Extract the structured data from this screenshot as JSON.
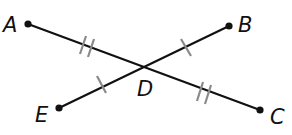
{
  "diagram": {
    "points": {
      "A": {
        "label": "A",
        "x": 28,
        "y": 24
      },
      "B": {
        "label": "B",
        "x": 229,
        "y": 26
      },
      "C": {
        "label": "C",
        "x": 260,
        "y": 110
      },
      "D": {
        "label": "D",
        "x": 143,
        "y": 68
      },
      "E": {
        "label": "E",
        "x": 59,
        "y": 108
      }
    },
    "segments": [
      {
        "name": "AC",
        "from": "A",
        "to": "C"
      },
      {
        "name": "EB",
        "from": "E",
        "to": "B"
      }
    ],
    "congruence_marks": [
      {
        "segment": "AD",
        "ticks": 2
      },
      {
        "segment": "DC",
        "ticks": 2
      },
      {
        "segment": "ED",
        "ticks": 1
      },
      {
        "segment": "DB",
        "ticks": 1
      }
    ],
    "colors": {
      "line": "#111111",
      "tick": "#8a8a8a",
      "background": "#ffffff"
    }
  }
}
